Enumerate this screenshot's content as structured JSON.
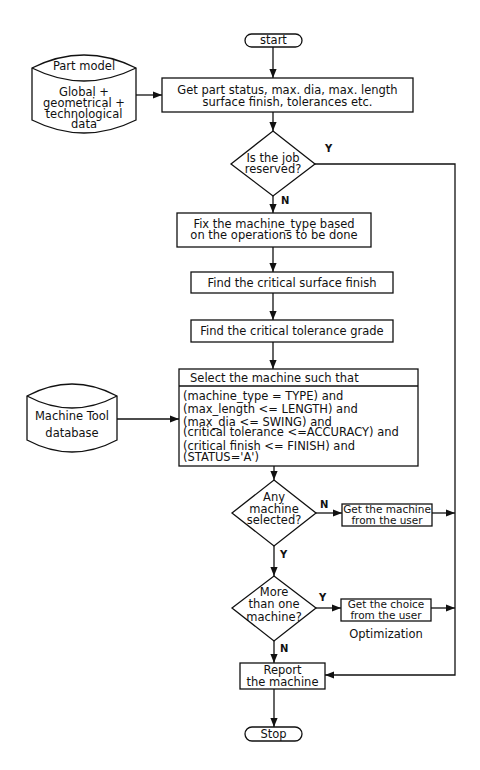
{
  "diagram": {
    "type": "flowchart",
    "nodes": {
      "start": {
        "shape": "terminator",
        "label": "start"
      },
      "part_model": {
        "shape": "database",
        "title": "Part model",
        "lines": [
          "Global +",
          "geometrical +",
          "technological",
          "data"
        ]
      },
      "get_part_status": {
        "shape": "process",
        "lines": [
          "Get part status, max. dia, max. length",
          "surface finish, tolerances etc."
        ]
      },
      "job_reserved": {
        "shape": "decision",
        "lines": [
          "Is the job",
          "reserved?"
        ],
        "yes_label": "Y",
        "no_label": "N"
      },
      "fix_machine_type": {
        "shape": "process",
        "lines": [
          "Fix the machine_type based",
          "on the operations to be done"
        ]
      },
      "critical_surface": {
        "shape": "process",
        "label": "Find the critical surface finish"
      },
      "critical_tolerance": {
        "shape": "process",
        "label": "Find the critical tolerance grade"
      },
      "select_machine": {
        "shape": "process",
        "header": "Select the machine such that",
        "conditions": [
          "(machine_type = TYPE) and",
          "(max_length <= LENGTH) and",
          "(max_dia <= SWING) and",
          "(critical tolerance <=ACCURACY) and",
          "(critical finish <= FINISH) and",
          "(STATUS='A')"
        ]
      },
      "machine_tool_db": {
        "shape": "database",
        "lines": [
          "Machine Tool",
          "database"
        ]
      },
      "any_selected": {
        "shape": "decision",
        "lines": [
          "Any",
          "machine",
          "selected?"
        ],
        "yes_label": "Y",
        "no_label": "N"
      },
      "get_machine_user": {
        "shape": "process",
        "lines": [
          "Get the machine",
          "from the user"
        ]
      },
      "more_than_one": {
        "shape": "decision",
        "lines": [
          "More",
          "than one",
          "machine?"
        ],
        "yes_label": "Y",
        "no_label": "N"
      },
      "get_choice_user": {
        "shape": "process",
        "lines": [
          "Get the choice",
          "from the user"
        ],
        "caption": "Optimization"
      },
      "report": {
        "shape": "process",
        "lines": [
          "Report",
          "the machine"
        ]
      },
      "stop": {
        "shape": "terminator",
        "label": "Stop"
      }
    },
    "edges": [
      {
        "from": "start",
        "to": "get_part_status"
      },
      {
        "from": "part_model",
        "to": "get_part_status"
      },
      {
        "from": "get_part_status",
        "to": "job_reserved"
      },
      {
        "from": "job_reserved",
        "to": "fix_machine_type",
        "label": "N"
      },
      {
        "from": "job_reserved",
        "to": "report",
        "label": "Y"
      },
      {
        "from": "fix_machine_type",
        "to": "critical_surface"
      },
      {
        "from": "critical_surface",
        "to": "critical_tolerance"
      },
      {
        "from": "critical_tolerance",
        "to": "select_machine"
      },
      {
        "from": "machine_tool_db",
        "to": "select_machine"
      },
      {
        "from": "select_machine",
        "to": "any_selected"
      },
      {
        "from": "any_selected",
        "to": "get_machine_user",
        "label": "N"
      },
      {
        "from": "any_selected",
        "to": "more_than_one",
        "label": "Y"
      },
      {
        "from": "get_machine_user",
        "to": "report"
      },
      {
        "from": "more_than_one",
        "to": "get_choice_user",
        "label": "Y"
      },
      {
        "from": "more_than_one",
        "to": "report",
        "label": "N"
      },
      {
        "from": "get_choice_user",
        "to": "report"
      },
      {
        "from": "report",
        "to": "stop"
      }
    ],
    "colors": {
      "stroke": "#111111",
      "background": "#ffffff"
    }
  }
}
